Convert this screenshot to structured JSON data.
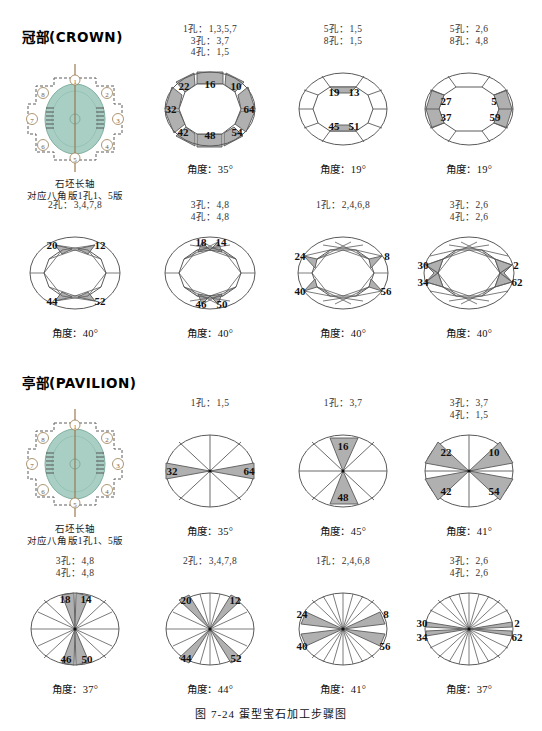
{
  "caption": "图 7-24  蛋型宝石加工步骤图",
  "colors": {
    "facet_fill": "#b0b0b0",
    "outline": "#5a5a5a",
    "stone_fill": "#a9cfc4",
    "dop_outline": "#5d5d5d",
    "axis_line": "#9a7b4f",
    "number": "#111111"
  },
  "sections": [
    {
      "id": "crown",
      "title": "冠部(CROWN)",
      "reference": {
        "name": "crown-reference-diagram",
        "axis_label": "石坯长轴\n对应八角版1孔1、5版",
        "positions": [
          "1",
          "2",
          "3",
          "4",
          "5",
          "6",
          "7",
          "8"
        ]
      },
      "steps": [
        {
          "holes": "1孔：1,3,5,7\n3孔：3,7\n4孔：1,5",
          "angle": "角度：35°",
          "type": "octagon-ring",
          "labels": [
            {
              "text": "16",
              "x": 65,
              "y": 25
            },
            {
              "text": "10",
              "x": 91,
              "y": 27
            },
            {
              "text": "64",
              "x": 104,
              "y": 50
            },
            {
              "text": "54",
              "x": 92,
              "y": 73
            },
            {
              "text": "48",
              "x": 65,
              "y": 76
            },
            {
              "text": "42",
              "x": 38,
              "y": 73
            },
            {
              "text": "32",
              "x": 26,
              "y": 50
            },
            {
              "text": "22",
              "x": 39,
              "y": 27
            }
          ]
        },
        {
          "holes": "5孔：1,5\n8孔：1,5",
          "angle": "角度：19°",
          "type": "oval-8facet",
          "labels": [
            {
              "text": "19",
              "x": 56,
              "y": 33
            },
            {
              "text": "13",
              "x": 76,
              "y": 33
            },
            {
              "text": "45",
              "x": 56,
              "y": 67
            },
            {
              "text": "51",
              "x": 76,
              "y": 67
            }
          ]
        },
        {
          "holes": "5孔：2,6\n8孔：4,8",
          "angle": "角度：19°",
          "type": "oval-8facet-side",
          "labels": [
            {
              "text": "27",
              "x": 42,
              "y": 42
            },
            {
              "text": "5",
              "x": 90,
              "y": 42
            },
            {
              "text": "37",
              "x": 42,
              "y": 58
            },
            {
              "text": "59",
              "x": 91,
              "y": 58
            }
          ]
        }
      ],
      "steps2": [
        {
          "holes": "2孔：3,4,7,8",
          "angle": "角度：40°",
          "type": "oval-star16",
          "labels": [
            {
              "text": "20",
              "x": 42,
              "y": 22
            },
            {
              "text": "12",
              "x": 90,
              "y": 22
            },
            {
              "text": "44",
              "x": 42,
              "y": 78
            },
            {
              "text": "52",
              "x": 90,
              "y": 78
            }
          ]
        },
        {
          "holes": "3孔：4,8\n4孔：4,8",
          "angle": "角度：40°",
          "type": "oval-star24",
          "labels": [
            {
              "text": "18",
              "x": 56,
              "y": 19
            },
            {
              "text": "14",
              "x": 76,
              "y": 19
            },
            {
              "text": "46",
              "x": 56,
              "y": 81
            },
            {
              "text": "50",
              "x": 77,
              "y": 81
            }
          ]
        },
        {
          "holes": "1孔：2,4,6,8",
          "angle": "角度：40°",
          "type": "oval-star24b",
          "labels": [
            {
              "text": "24",
              "x": 22,
              "y": 33
            },
            {
              "text": "8",
              "x": 109,
              "y": 33
            },
            {
              "text": "40",
              "x": 22,
              "y": 68
            },
            {
              "text": "56",
              "x": 108,
              "y": 68
            }
          ]
        },
        {
          "holes": "3孔：2,6\n4孔：2,6",
          "angle": "角度：40°",
          "type": "oval-star32",
          "labels": [
            {
              "text": "30",
              "x": 19,
              "y": 42
            },
            {
              "text": "2",
              "x": 112,
              "y": 42
            },
            {
              "text": "34",
              "x": 19,
              "y": 59
            },
            {
              "text": "62",
              "x": 113,
              "y": 59
            }
          ]
        }
      ]
    },
    {
      "id": "pavilion",
      "title": "亭部(PAVILION)",
      "reference": {
        "name": "pavilion-reference-diagram",
        "axis_label": "石坯长轴\n对应八角版1孔1、5版",
        "positions": [
          "1",
          "2",
          "3",
          "4",
          "5",
          "6",
          "7",
          "8"
        ]
      },
      "steps": [
        {
          "holes": "1孔：1,5",
          "angle": "角度：35°",
          "type": "pie8-h",
          "labels": [
            {
              "text": "32",
              "x": 27,
              "y": 50
            },
            {
              "text": "64",
              "x": 104,
              "y": 50
            }
          ]
        },
        {
          "holes": "1孔：3,7",
          "angle": "角度：45°",
          "type": "pie8-v",
          "labels": [
            {
              "text": "16",
              "x": 65,
              "y": 25
            },
            {
              "text": "48",
              "x": 65,
              "y": 76
            }
          ]
        },
        {
          "holes": "3孔：3,7\n4孔：1,5",
          "angle": "角度：41°",
          "type": "pie8-diag",
          "labels": [
            {
              "text": "22",
              "x": 42,
              "y": 31
            },
            {
              "text": "10",
              "x": 90,
              "y": 31
            },
            {
              "text": "42",
              "x": 42,
              "y": 70
            },
            {
              "text": "54",
              "x": 90,
              "y": 70
            }
          ]
        }
      ],
      "steps2": [
        {
          "holes": "3孔：4,8\n4孔：4,8",
          "angle": "角度：37°",
          "type": "pie16-a",
          "labels": [
            {
              "text": "18",
              "x": 55,
              "y": 20
            },
            {
              "text": "14",
              "x": 76,
              "y": 20
            },
            {
              "text": "46",
              "x": 56,
              "y": 80
            },
            {
              "text": "50",
              "x": 77,
              "y": 80
            }
          ]
        },
        {
          "holes": "2孔：3,4,7,8",
          "angle": "角度：44°",
          "type": "pie16-b",
          "labels": [
            {
              "text": "20",
              "x": 41,
              "y": 21
            },
            {
              "text": "12",
              "x": 90,
              "y": 21
            },
            {
              "text": "44",
              "x": 41,
              "y": 79
            },
            {
              "text": "52",
              "x": 91,
              "y": 79
            }
          ]
        },
        {
          "holes": "1孔：2,4,6,8",
          "angle": "角度：41°",
          "type": "pie24-a",
          "labels": [
            {
              "text": "24",
              "x": 24,
              "y": 35
            },
            {
              "text": "8",
              "x": 108,
              "y": 35
            },
            {
              "text": "40",
              "x": 24,
              "y": 67
            },
            {
              "text": "56",
              "x": 107,
              "y": 67
            }
          ]
        },
        {
          "holes": "3孔：2,6\n4孔：2,6",
          "angle": "角度：37°",
          "type": "pie24-b",
          "labels": [
            {
              "text": "30",
              "x": 18,
              "y": 44
            },
            {
              "text": "2",
              "x": 113,
              "y": 44
            },
            {
              "text": "34",
              "x": 18,
              "y": 58
            },
            {
              "text": "62",
              "x": 113,
              "y": 58
            }
          ]
        }
      ]
    }
  ]
}
